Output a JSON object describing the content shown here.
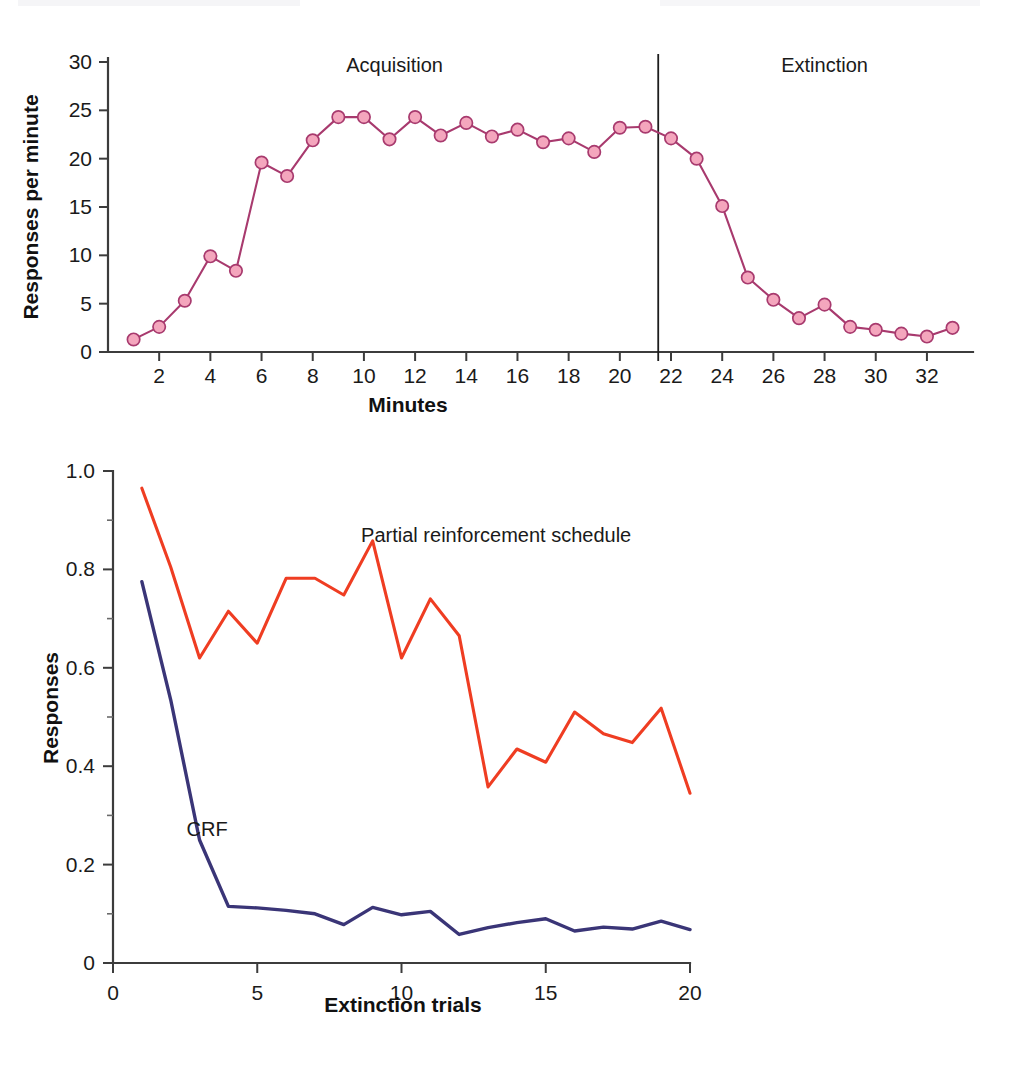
{
  "chart_data": [
    {
      "type": "line",
      "id": "acquisition-extinction-curve",
      "title": "",
      "xlabel": "Minutes",
      "ylabel": "Responses per minute",
      "xlim": [
        0,
        33.8
      ],
      "ylim": [
        0,
        30
      ],
      "grid": false,
      "legend": "none",
      "xticks": [
        2,
        4,
        6,
        8,
        10,
        12,
        14,
        16,
        18,
        20,
        22,
        24,
        26,
        28,
        30,
        32
      ],
      "xticklabels": [
        "2",
        "4",
        "6",
        "8",
        "10",
        "12",
        "14",
        "16",
        "18",
        "20",
        "22",
        "24",
        "26",
        "28",
        "30",
        "32"
      ],
      "yticks": [
        0,
        5,
        10,
        15,
        20,
        25,
        30
      ],
      "yticklabels": [
        "0",
        "5",
        "10",
        "15",
        "20",
        "25",
        "30"
      ],
      "marker": "filled-circle",
      "marker_color": "#f4a6bd",
      "line_color": "#a83a6e",
      "annotations": [
        {
          "text": "Acquisition",
          "x": 11.2,
          "y": 29.0
        },
        {
          "text": "Extinction",
          "x": 28.0,
          "y": 29.0
        }
      ],
      "phase_divider_x": 21.5,
      "x": [
        1,
        2,
        3,
        4,
        5,
        6,
        7,
        8,
        9,
        10,
        11,
        12,
        13,
        14,
        15,
        16,
        17,
        18,
        19,
        20,
        21,
        22,
        23,
        24,
        25,
        26,
        27,
        28,
        29,
        30,
        31,
        32,
        33
      ],
      "values": [
        1.3,
        2.6,
        5.3,
        9.9,
        8.4,
        19.6,
        18.2,
        21.9,
        24.3,
        24.3,
        22.0,
        24.3,
        22.4,
        23.7,
        22.3,
        23.0,
        21.7,
        22.1,
        20.7,
        23.2,
        23.3,
        22.1,
        20.0,
        15.1,
        7.7,
        5.4,
        3.5,
        4.9,
        2.6,
        2.3,
        1.9,
        1.6,
        2.5
      ]
    },
    {
      "type": "line",
      "id": "extinction-trials-curve",
      "title": "",
      "xlabel": "Extinction trials",
      "ylabel": "Responses",
      "xlim": [
        0,
        20
      ],
      "ylim": [
        0,
        1.0
      ],
      "grid": false,
      "legend": "inline-labels",
      "xticks": [
        0,
        5,
        10,
        15,
        20
      ],
      "xticklabels": [
        "0",
        "5",
        "10",
        "15",
        "20"
      ],
      "yticks": [
        0,
        0.2,
        0.4,
        0.6,
        0.8,
        1.0
      ],
      "yticklabels": [
        "0",
        "0.2",
        "0.4",
        "0.6",
        "0.8",
        "1.0"
      ],
      "yticks_minor": [
        0.1,
        0.3,
        0.5,
        0.7,
        0.9
      ],
      "x": [
        1,
        2,
        3,
        4,
        5,
        6,
        7,
        8,
        9,
        10,
        11,
        12,
        13,
        14,
        15,
        16,
        17,
        18,
        19,
        20
      ],
      "series": [
        {
          "name": "Partial reinforcement schedule",
          "color": "#ef3d22",
          "label_x": 8.6,
          "label_y": 0.855,
          "values": [
            0.965,
            0.805,
            0.62,
            0.715,
            0.65,
            0.782,
            0.782,
            0.748,
            0.858,
            0.62,
            0.74,
            0.665,
            0.358,
            0.435,
            0.408,
            0.51,
            0.466,
            0.448,
            0.518,
            0.345
          ]
        },
        {
          "name": "CRF",
          "color": "#3a3577",
          "label_x": 2.55,
          "label_y": 0.258,
          "values": [
            0.775,
            0.535,
            0.25,
            0.115,
            0.112,
            0.107,
            0.1,
            0.078,
            0.113,
            0.098,
            0.105,
            0.058,
            0.072,
            0.082,
            0.09,
            0.065,
            0.073,
            0.069,
            0.085,
            0.068
          ]
        }
      ]
    }
  ],
  "fig_top": {
    "ylabel": "Responses per minute",
    "xlabel": "Minutes",
    "phase_left": "Acquisition",
    "phase_right": "Extinction",
    "yticklabels": [
      "30",
      "25",
      "20",
      "15",
      "10",
      "5",
      "0"
    ],
    "xticklabels": [
      "2",
      "4",
      "6",
      "8",
      "10",
      "12",
      "14",
      "16",
      "18",
      "20",
      "22",
      "24",
      "26",
      "28",
      "30",
      "32"
    ]
  },
  "fig_bottom": {
    "ylabel": "Responses",
    "xlabel": "Extinction trials",
    "label_partial": "Partial reinforcement schedule",
    "label_crf": "CRF",
    "yticklabels": [
      "1.0",
      "0.8",
      "0.6",
      "0.4",
      "0.2",
      "0"
    ],
    "xticklabels": [
      "0",
      "5",
      "10",
      "15",
      "20"
    ]
  },
  "colors": {
    "marker_fill": "#f4a6bd",
    "marker_stroke": "#a83a6e",
    "partial_line": "#ef3d22",
    "crf_line": "#3a3577",
    "axis": "#3c3c3c"
  }
}
